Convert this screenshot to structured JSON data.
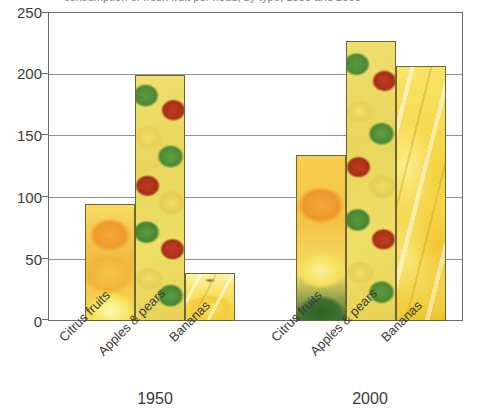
{
  "caption": {
    "clipped_top_text": "consumption of fresh fruit per head, by type, 1950 and 2000"
  },
  "chart_data": {
    "type": "bar",
    "title": "",
    "subtitle": "",
    "xlabel": "",
    "ylabel": "",
    "ylim": [
      0,
      250
    ],
    "yticks": [
      0,
      50,
      100,
      150,
      200,
      250
    ],
    "ytick_labels": [
      "0",
      "50",
      "100",
      "150",
      "200",
      "250"
    ],
    "grid": true,
    "grid_axis": "y",
    "legend": false,
    "legend_position": "none",
    "group_labels": [
      "1950",
      "2000"
    ],
    "categories": [
      "Citrus fruits",
      "Apples & pears",
      "Bananas"
    ],
    "series": [
      {
        "name": "1950",
        "values": [
          95,
          200,
          39
        ]
      },
      {
        "name": "2000",
        "values": [
          135,
          228,
          208
        ]
      }
    ],
    "bars": [
      {
        "group": "1950",
        "category": "Citrus fruits",
        "value": 95,
        "fill": "citrus"
      },
      {
        "group": "1950",
        "category": "Apples & pears",
        "value": 200,
        "fill": "apples"
      },
      {
        "group": "1950",
        "category": "Bananas",
        "value": 39,
        "fill": "bananas-small"
      },
      {
        "group": "2000",
        "category": "Citrus fruits",
        "value": 135,
        "fill": "citrus2000"
      },
      {
        "group": "2000",
        "category": "Apples & pears",
        "value": 228,
        "fill": "apples"
      },
      {
        "group": "2000",
        "category": "Bananas",
        "value": 208,
        "fill": "bananas"
      }
    ],
    "colors": {
      "axis": "#6b6b6b",
      "gridline": "#8f8f8f",
      "bar_border": "#6b6632",
      "text": "#3b3b3b",
      "citrus_orange": "#f0b53a",
      "citrus_lemon": "#f6e45c",
      "apple_red": "#bf3a22",
      "apple_green": "#5d9a3e",
      "pear_yellow": "#efdd66",
      "banana_yellow": "#f4d23f",
      "leaf_green": "#3f6b2e",
      "background": "#ffffff"
    }
  },
  "axis": {
    "ytick_0": "0",
    "ytick_50": "50",
    "ytick_100": "100",
    "ytick_150": "150",
    "ytick_200": "200",
    "ytick_250": "250"
  },
  "labels": {
    "cat_1950_citrus": "Citrus fruits",
    "cat_1950_apples": "Apples & pears",
    "cat_1950_bananas": "Bananas",
    "cat_2000_citrus": "Citrus fruits",
    "cat_2000_apples": "Apples & pears",
    "cat_2000_bananas": "Bananas",
    "group_1950": "1950",
    "group_2000": "2000"
  }
}
